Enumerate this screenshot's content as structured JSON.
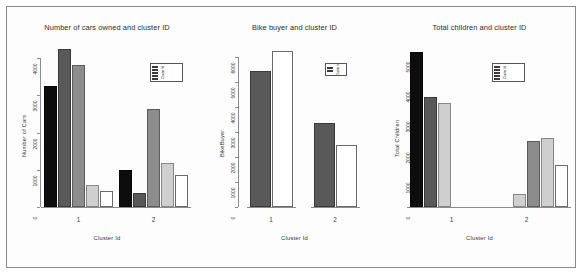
{
  "figure": {
    "background": "#ffffff",
    "border_color": "#8a8a8a"
  },
  "colors": {
    "black": "#0d0d0d",
    "dark_gray": "#595959",
    "mid_gray": "#8c8c8c",
    "light_gray": "#cfcfcf",
    "white": "#ffffff",
    "axis": "#8c8c8c",
    "text": "#2b2b2b"
  },
  "chart_data": [
    {
      "type": "bar",
      "title": "Number of cars owned and cluster ID",
      "xlabel": "Cluster Id",
      "ylabel": "Number of Cars",
      "categories": [
        "1",
        "2"
      ],
      "ylim": [
        0,
        4300
      ],
      "yticks": [
        0,
        1000,
        2000,
        3000,
        4000
      ],
      "ytick_labels": [
        "0",
        "1000",
        "2000",
        "3000",
        "4000"
      ],
      "grid": false,
      "legend_position": "top-right",
      "series": [
        {
          "name": "0",
          "color": "#0d0d0d",
          "values": [
            3250,
            1000
          ]
        },
        {
          "name": "1",
          "color": "#595959",
          "values": [
            4250,
            370
          ]
        },
        {
          "name": "2",
          "color": "#8c8c8c",
          "values": [
            3820,
            2640
          ]
        },
        {
          "name": "3",
          "color": "#cfcfcf",
          "values": [
            600,
            1180
          ]
        },
        {
          "name": "4",
          "color": "#ffffff",
          "values": [
            430,
            870
          ]
        }
      ]
    },
    {
      "type": "bar",
      "title": "Bike buyer and cluster ID",
      "xlabel": "Cluster Id",
      "ylabel": "BikeBuyer",
      "categories": [
        "1",
        "2"
      ],
      "ylim": [
        0,
        6400
      ],
      "yticks": [
        0,
        1000,
        2000,
        3000,
        4000,
        5000,
        6000
      ],
      "ytick_labels": [
        "0",
        "1000",
        "2000",
        "3000",
        "4000",
        "5000",
        "6000"
      ],
      "grid": false,
      "legend_position": "top-right",
      "series": [
        {
          "name": "0",
          "color": "#595959",
          "values": [
            5450,
            3350
          ]
        },
        {
          "name": "1",
          "color": "#ffffff",
          "values": [
            6250,
            2500
          ]
        }
      ]
    },
    {
      "type": "bar",
      "title": "Total children and cluster ID",
      "xlabel": "Cluster Id",
      "ylabel": "Total Children",
      "categories": [
        "1",
        "2"
      ],
      "ylim": [
        0,
        5300
      ],
      "yticks": [
        0,
        1000,
        2000,
        3000,
        4000,
        5000
      ],
      "ytick_labels": [
        "0",
        "1000",
        "2000",
        "3000",
        "4000",
        "5000"
      ],
      "grid": false,
      "legend_position": "top-right",
      "series": [
        {
          "name": "0",
          "color": "#0d0d0d",
          "values": [
            5150,
            0
          ]
        },
        {
          "name": "1",
          "color": "#595959",
          "values": [
            3650,
            0
          ]
        },
        {
          "name": "2",
          "color": "#cfcfcf",
          "values": [
            3450,
            430
          ]
        },
        {
          "name": "3",
          "color": "#8c8c8c",
          "values": [
            0,
            2180
          ]
        },
        {
          "name": "4",
          "color": "#cfcfcf",
          "values": [
            0,
            2300
          ]
        },
        {
          "name": "5",
          "color": "#ffffff",
          "values": [
            0,
            1400
          ]
        }
      ]
    }
  ],
  "legends": [
    {
      "chart": "Number of cars owned and cluster ID",
      "label": "Cluster Id",
      "entries": [
        "0",
        "1",
        "2",
        "3",
        "4"
      ]
    },
    {
      "chart": "Bike buyer and cluster ID",
      "label": "Cluster Id",
      "entries": [
        "0",
        "1"
      ]
    },
    {
      "chart": "Total children and cluster ID",
      "label": "Cluster Id",
      "entries": [
        "0",
        "1",
        "2",
        "3",
        "4"
      ]
    }
  ]
}
